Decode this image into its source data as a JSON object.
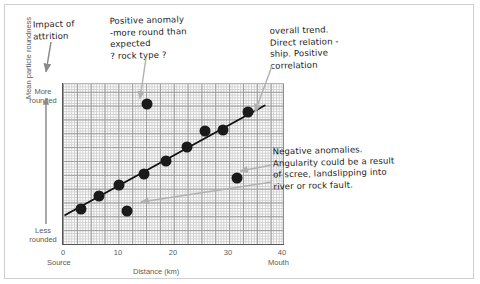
{
  "chart_data": {
    "type": "scatter",
    "title": "",
    "xlabel": "Distance (km)",
    "ylabel": "Mean particle roundness",
    "xlim": [
      0,
      40
    ],
    "ylim": [
      0,
      100
    ],
    "xticks": [
      "0",
      "10",
      "20",
      "30",
      "40"
    ],
    "xtick_values": [
      0,
      10,
      20,
      30,
      40
    ],
    "x_axis_start_label": "Source",
    "x_axis_end_label": "Mouth",
    "y_axis_top_label": "More rounded",
    "y_axis_bottom_label": "Less rounded",
    "grid": true,
    "legend": "none",
    "series": [
      {
        "name": "Mean particle roundness samples",
        "points": [
          {
            "x": 3.2,
            "y": 22.5,
            "note": "on-trend"
          },
          {
            "x": 6.4,
            "y": 30.2,
            "note": "on-trend"
          },
          {
            "x": 10.0,
            "y": 37.0,
            "note": "on-trend"
          },
          {
            "x": 14.6,
            "y": 43.8,
            "note": "on-trend"
          },
          {
            "x": 18.6,
            "y": 51.9,
            "note": "on-trend"
          },
          {
            "x": 22.4,
            "y": 60.5,
            "note": "on-trend"
          },
          {
            "x": 25.6,
            "y": 70.4,
            "note": "positive-anomaly-mild"
          },
          {
            "x": 28.8,
            "y": 71.0,
            "note": "on-trend"
          },
          {
            "x": 33.4,
            "y": 82.1,
            "note": "on-trend"
          },
          {
            "x": 15.1,
            "y": 87.0,
            "note": "positive-anomaly"
          },
          {
            "x": 11.6,
            "y": 21.0,
            "note": "negative-anomaly"
          },
          {
            "x": 31.4,
            "y": 41.4,
            "note": "negative-anomaly"
          }
        ]
      }
    ],
    "trendline": {
      "label": "overall trend",
      "type": "linear",
      "x_start": 0.4,
      "y_start": 18.0,
      "x_end": 36.5,
      "y_end": 86.0
    }
  },
  "annotations": {
    "attrition": "Impact of\nattrition",
    "positive_anomaly": "Positive anomaly\n-more round than\n expected\n  ? rock type ?",
    "overall_trend": "overall trend.\nDirect relation -\nship. Positive\ncorrelation",
    "negative_anomaly": "   Negative anomalies.\nAngularity could be a result\nof scree, landslipping into\nriver or rock fault."
  },
  "axes": {
    "y_title": "Mean particle roundness",
    "y_top": "More\nrounded",
    "y_bottom": "Less\nrounded",
    "x_title": "Distance (km)",
    "source": "Source",
    "mouth": "Mouth",
    "ticks": [
      "0",
      "10",
      "20",
      "30",
      "40"
    ]
  }
}
